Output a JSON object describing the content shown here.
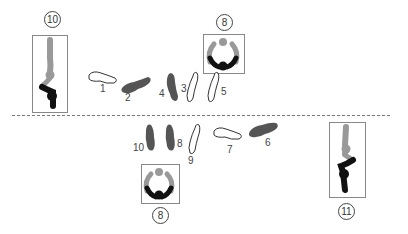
{
  "figure": {
    "top_row": {
      "side_view_label": "10",
      "top_view_label": "8",
      "steps": [
        {
          "n": "1",
          "fill": "outline"
        },
        {
          "n": "2",
          "fill": "dark"
        },
        {
          "n": "4",
          "fill": "dark"
        },
        {
          "n": "3",
          "fill": "outline"
        },
        {
          "n": "5",
          "fill": "outline"
        }
      ]
    },
    "bottom_row": {
      "side_view_label": "11",
      "top_view_label": "8",
      "steps": [
        {
          "n": "10",
          "fill": "dark"
        },
        {
          "n": "8",
          "fill": "dark"
        },
        {
          "n": "9",
          "fill": "outline"
        },
        {
          "n": "7",
          "fill": "outline"
        },
        {
          "n": "6",
          "fill": "dark"
        }
      ]
    },
    "colors": {
      "dark_foot": "#555555",
      "figure_black": "#111111",
      "figure_gray": "#999999",
      "outline": "#333333"
    }
  }
}
